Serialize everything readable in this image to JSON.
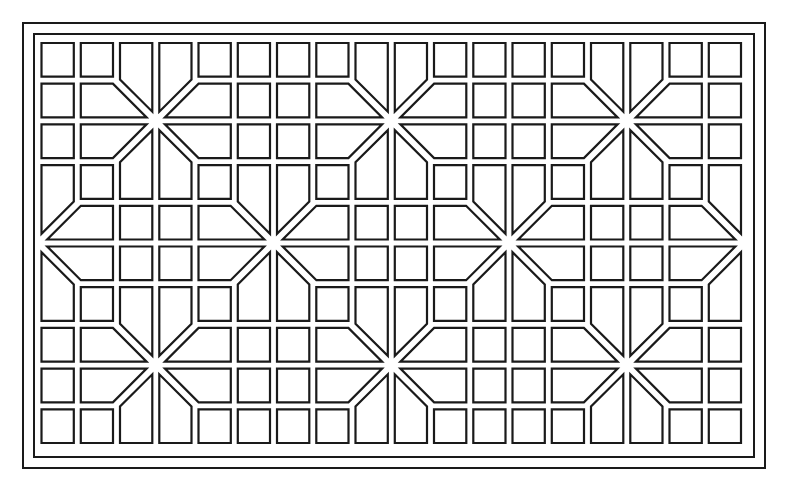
{
  "figure": {
    "width": 785,
    "height": 487,
    "background": "#ffffff",
    "line_color": "#1a1a1a"
  },
  "frames": [
    {
      "name": "outer-frame",
      "x": 23,
      "y": 23,
      "w": 742,
      "h": 445
    },
    {
      "name": "inner-frame",
      "x": 34,
      "y": 34,
      "w": 720,
      "h": 423
    }
  ],
  "grid": {
    "cols": 18,
    "rows": 10,
    "x0": 41.5,
    "y0": 43,
    "pitch_x": 39.25,
    "pitch_y": 40.7,
    "gap": 7,
    "star_half_band": 4
  },
  "stars": [
    {
      "col_line": 3,
      "row_line": 2
    },
    {
      "col_line": 9,
      "row_line": 2
    },
    {
      "col_line": 15,
      "row_line": 2
    },
    {
      "col_line": 0,
      "row_line": 5
    },
    {
      "col_line": 6,
      "row_line": 5
    },
    {
      "col_line": 12,
      "row_line": 5
    },
    {
      "col_line": 18,
      "row_line": 5
    },
    {
      "col_line": 3,
      "row_line": 8
    },
    {
      "col_line": 9,
      "row_line": 8
    },
    {
      "col_line": 15,
      "row_line": 8
    }
  ]
}
